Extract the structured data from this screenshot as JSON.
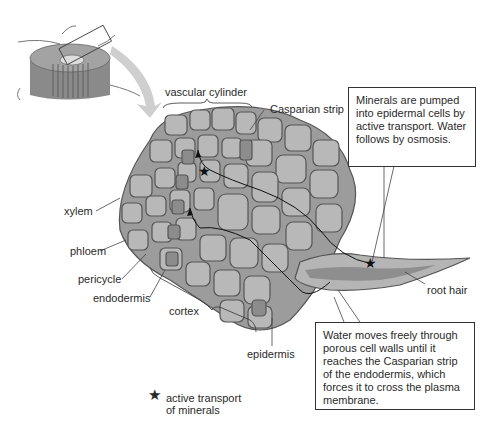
{
  "diagram": {
    "labels": {
      "vascular_cylinder": "vascular cylinder",
      "casparian_strip": "Casparian strip",
      "xylem": "xylem",
      "phloem": "phloem",
      "pericycle": "pericycle",
      "endodermis": "endodermis",
      "cortex": "cortex",
      "epidermis": "epidermis",
      "root_hair": "root hair"
    },
    "callouts": {
      "top": "Minerals are pumped into epidermal cells by active transport. Water follows by osmosis.",
      "bottom": "Water moves freely through porous cell walls until it reaches the Casparian strip of the endodermis, which forces it to cross the plasma membrane."
    },
    "legend": {
      "symbol": "★",
      "line1": "active transport",
      "line2": "of minerals"
    },
    "colors": {
      "cell_fill": "#b8b8b8",
      "cell_inner": "#cfcfcf",
      "endodermis_dark": "#8c8c8c",
      "outline": "#5a5a5a",
      "arrow": "#c8c8c8",
      "callout_border": "#333333"
    }
  }
}
